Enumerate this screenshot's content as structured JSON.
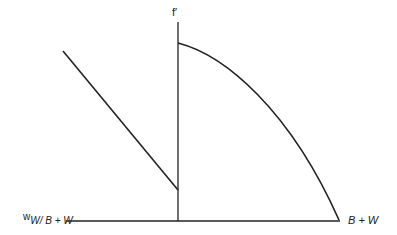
{
  "diagram": {
    "colors": {
      "background": "#ffffff",
      "stroke": "#222222"
    },
    "labels": {
      "vertical_axis": "f′",
      "left_axis_prefix": "w",
      "left_axis_sub": "W/ B + W",
      "right_axis": "B + W"
    },
    "geometry": {
      "vertical_axis": {
        "x": 178,
        "y1": 22,
        "y2": 221
      },
      "horizontal_axis": {
        "x1": 66,
        "x2": 340,
        "y": 221
      },
      "straight_line": {
        "x1": 63,
        "y1": 51,
        "x2": 178,
        "y2": 190
      },
      "curve": {
        "start": [
          178,
          43
        ],
        "end": [
          339,
          220
        ],
        "shape": "concave-down arc"
      }
    }
  }
}
